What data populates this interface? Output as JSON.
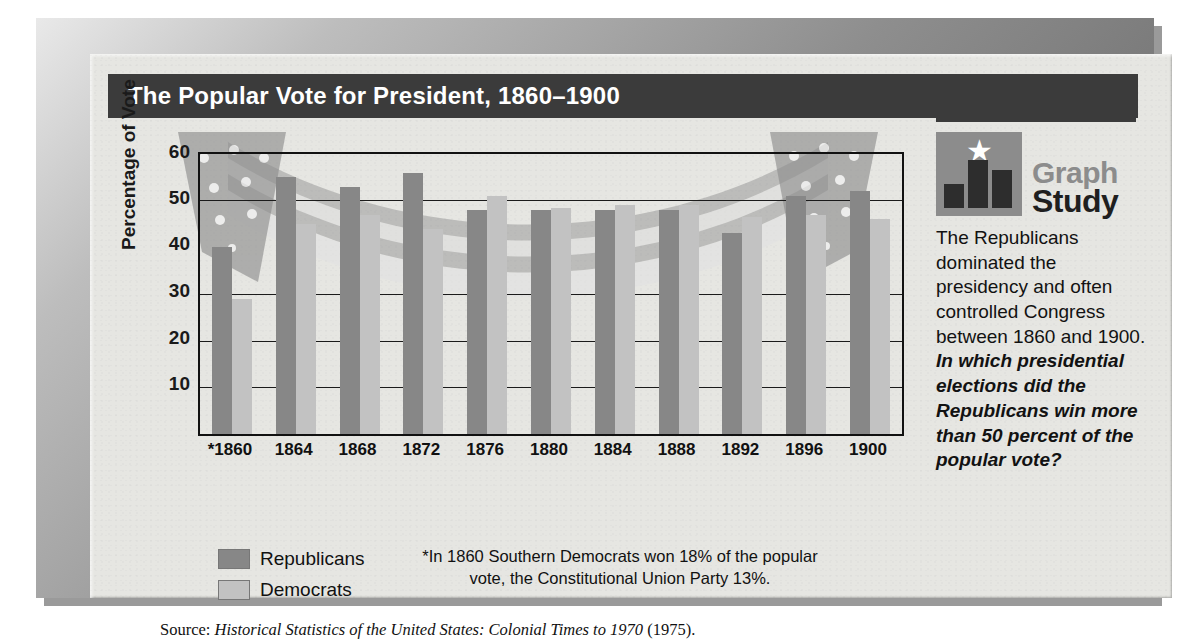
{
  "title": "The Popular Vote for President, 1860–1900",
  "chart_data": {
    "type": "bar",
    "title": "The Popular Vote for President, 1860–1900",
    "xlabel": "",
    "ylabel": "Percentage of Vote",
    "ylim": [
      0,
      60
    ],
    "yticks": [
      60,
      50,
      40,
      30,
      20,
      10
    ],
    "gridlines": [
      50,
      30,
      20,
      10
    ],
    "grid": true,
    "legend_position": "bottom-left",
    "categories": [
      "*1860",
      "1864",
      "1868",
      "1872",
      "1876",
      "1880",
      "1884",
      "1888",
      "1892",
      "1896",
      "1900"
    ],
    "series": [
      {
        "name": "Republicans",
        "color": "#878787",
        "values": [
          40,
          55,
          53,
          56,
          48,
          48,
          48,
          48,
          43,
          51,
          52
        ]
      },
      {
        "name": "Democrats",
        "color": "#c2c2c2",
        "values": [
          29,
          45,
          47,
          44,
          51,
          48.5,
          49,
          49,
          46.5,
          47,
          46
        ]
      }
    ],
    "footnote": "*In 1860 Southern Democrats won 18% of the popular vote, the Constitutional Union Party 13%.",
    "source_label": "Source:",
    "source_title": "Historical Statistics of the United States: Colonial Times to 1970",
    "source_suffix": "(1975)."
  },
  "legend": {
    "items": [
      {
        "label": "Republicans",
        "color": "#878787"
      },
      {
        "label": "Democrats",
        "color": "#c2c2c2"
      }
    ]
  },
  "sidebar": {
    "logo_word_1": "Graph",
    "logo_word_2": "Study",
    "star_glyph": "★",
    "body_text": "The Republicans dominated the presidency and often controlled Congress between 1860 and 1900. ",
    "question_text": "In which presidential elections did the Republicans win more than 50 percent of the popular vote?"
  },
  "colors": {
    "title_bar": "#3b3b3b",
    "paper": "#e6e6e2",
    "republican": "#878787",
    "democrat": "#c2c2c2",
    "axis": "#111111"
  }
}
